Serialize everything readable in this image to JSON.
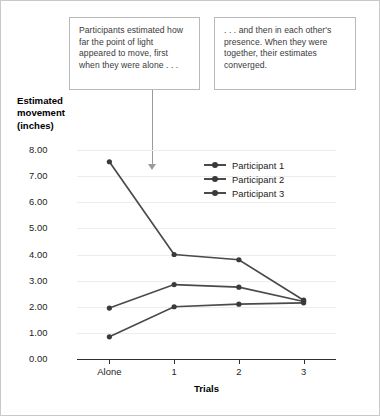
{
  "callouts": [
    {
      "id": "left",
      "text": "Participants estimated how far the point of light appeared to move, first when they were alone . . ."
    },
    {
      "id": "right",
      "text": ". . . and then in each other's presence. When they were together, their estimates converged."
    }
  ],
  "legend": {
    "position": "inside-top-right",
    "entries": [
      "Participant 1",
      "Participant 2",
      "Participant 3"
    ]
  },
  "colors": {
    "line": "#4a4a4a",
    "marker": "#3a3a3a",
    "axis": "#2f2f2f",
    "grid": "#ededed",
    "callout_border": "#b9b9b9",
    "frame_border": "#c9c9c9",
    "text": "#231f20"
  },
  "chart_data": {
    "type": "line",
    "title": "",
    "xlabel": "Trials",
    "ylabel": "Estimated movement (inches)",
    "categories": [
      "Alone",
      "1",
      "2",
      "3"
    ],
    "ylim": [
      0.0,
      8.0
    ],
    "yticks": [
      "0.00",
      "1.00",
      "2.00",
      "3.00",
      "4.00",
      "5.00",
      "6.00",
      "7.00",
      "8.00"
    ],
    "ytick_values": [
      0,
      1,
      2,
      3,
      4,
      5,
      6,
      7,
      8
    ],
    "grid": true,
    "legend_position": "inside-top-right",
    "series": [
      {
        "name": "Participant 1",
        "values": [
          7.55,
          4.0,
          3.8,
          2.25
        ]
      },
      {
        "name": "Participant 2",
        "values": [
          1.95,
          2.85,
          2.75,
          2.2
        ]
      },
      {
        "name": "Participant 3",
        "values": [
          0.85,
          2.0,
          2.1,
          2.15
        ]
      }
    ]
  }
}
